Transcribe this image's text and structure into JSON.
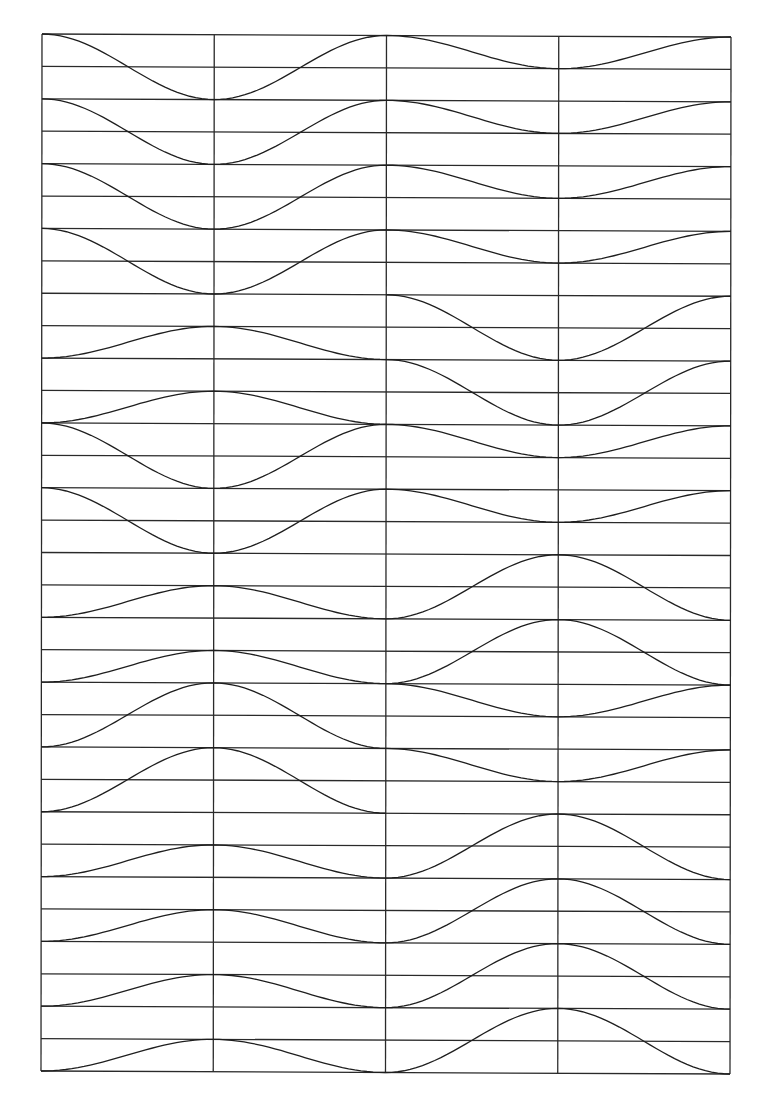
{
  "artwork": {
    "type": "line-art wave grid",
    "colors": {
      "background": "#ffffff",
      "line": "#222222"
    },
    "frame": {
      "top_left": [
        42,
        34
      ],
      "top_right": [
        731,
        37
      ],
      "bottom_left": [
        41,
        1071
      ],
      "bottom_right": [
        730,
        1074
      ]
    },
    "columns": 4,
    "rows": 32,
    "rows_per_band": 2,
    "band_level_key": "0 = top line of band, 1 = middle line, 2 = bottom line of band",
    "patterns": {
      "A": [
        0,
        2,
        0,
        1,
        0
      ],
      "B": [
        [
          2,
          1,
          2
        ],
        [
          0,
          2,
          0
        ]
      ],
      "C": [
        2,
        1,
        2,
        0,
        2
      ],
      "D": [
        [
          2,
          0,
          2
        ],
        [
          0,
          1,
          0
        ]
      ]
    },
    "bands": [
      "A",
      "A",
      "A",
      "A",
      "B",
      "B",
      "A",
      "A",
      "C",
      "C",
      "D",
      "D",
      "C",
      "C",
      "C",
      "C"
    ]
  }
}
